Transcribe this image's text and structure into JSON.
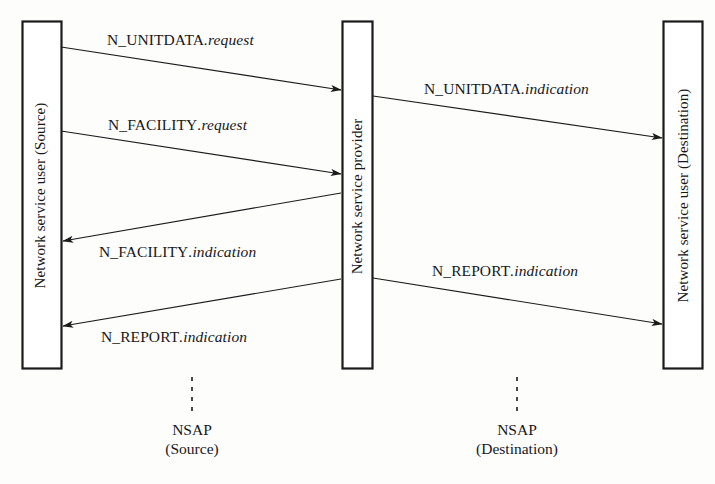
{
  "diagram": {
    "background_color": "#fdfdfc",
    "line_color": "#1b1b1b",
    "entities": [
      {
        "id": "source-user",
        "label": "Network service user (Source)",
        "x": 22,
        "y": 21,
        "width": 39,
        "height": 347
      },
      {
        "id": "provider",
        "label": "Network service provider",
        "x": 342,
        "y": 21,
        "width": 30,
        "height": 347
      },
      {
        "id": "destination-user",
        "label": "Network service user (Destination)",
        "x": 663,
        "y": 21,
        "width": 39,
        "height": 347
      }
    ],
    "messages": [
      {
        "id": "n-unitdata-request",
        "name": "N_UNITDATA",
        "kind": "request",
        "label_main": "N_UNITDATA",
        "label_suffix": ".request",
        "direction": "left-to-right",
        "from": "source-user",
        "to": "provider",
        "x1": 61,
        "y1": 47,
        "x2": 341,
        "y2": 90,
        "label_x": 107,
        "label_y": 31
      },
      {
        "id": "n-unitdata-indication",
        "name": "N_UNITDATA",
        "kind": "indication",
        "label_main": "N_UNITDATA",
        "label_suffix": ".indication",
        "direction": "left-to-right",
        "from": "provider",
        "to": "destination-user",
        "x1": 373,
        "y1": 96,
        "x2": 662,
        "y2": 138,
        "label_x": 424,
        "label_y": 80
      },
      {
        "id": "n-facility-request",
        "name": "N_FACILITY",
        "kind": "request",
        "label_main": "N_FACILITY",
        "label_suffix": ".request",
        "direction": "left-to-right",
        "from": "source-user",
        "to": "provider",
        "x1": 61,
        "y1": 131,
        "x2": 341,
        "y2": 174,
        "label_x": 108,
        "label_y": 116
      },
      {
        "id": "n-facility-indication",
        "name": "N_FACILITY",
        "kind": "indication",
        "label_main": "N_FACILITY",
        "label_suffix": ".indication",
        "direction": "right-to-left",
        "from": "provider",
        "to": "source-user",
        "x1": 341,
        "y1": 193,
        "x2": 62,
        "y2": 241,
        "label_x": 99,
        "label_y": 243
      },
      {
        "id": "n-report-indication-provider-to-destination",
        "name": "N_REPORT",
        "kind": "indication",
        "label_main": "N_REPORT",
        "label_suffix": ".indication",
        "direction": "left-to-right",
        "from": "provider",
        "to": "destination-user",
        "x1": 373,
        "y1": 278,
        "x2": 662,
        "y2": 324,
        "label_x": 432,
        "label_y": 262
      },
      {
        "id": "n-report-indication-provider-to-source",
        "name": "N_REPORT",
        "kind": "indication",
        "label_main": "N_REPORT",
        "label_suffix": ".indication",
        "direction": "right-to-left",
        "from": "provider",
        "to": "source-user",
        "x1": 341,
        "y1": 279,
        "x2": 62,
        "y2": 326,
        "label_x": 101,
        "label_y": 328
      }
    ],
    "nsaps": [
      {
        "id": "nsap-source",
        "line1": "NSAP",
        "line2": "(Source)",
        "marker_x": 192,
        "marker_y1": 377,
        "marker_y2": 416,
        "label_x": 192,
        "label_y": 420
      },
      {
        "id": "nsap-destination",
        "line1": "NSAP",
        "line2": "(Destination)",
        "marker_x": 517,
        "marker_y1": 377,
        "marker_y2": 416,
        "label_x": 517,
        "label_y": 420
      }
    ]
  }
}
